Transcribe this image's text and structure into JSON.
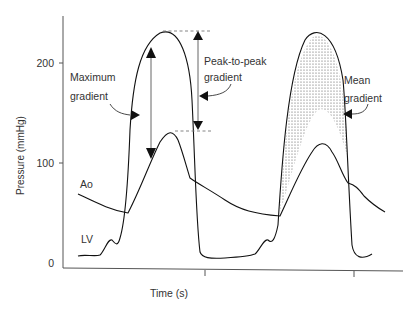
{
  "figure": {
    "y_axis": {
      "label": "Pressure (mmHg)",
      "ticks": [
        "200",
        "100",
        "0"
      ]
    },
    "x_axis": {
      "label": "Time (s)"
    },
    "curves": {
      "aorta_label": "Ao",
      "lv_label": "LV"
    },
    "annotations": {
      "maximum_line1": "Maximum",
      "maximum_line2": "gradient",
      "peak_line1": "Peak-to-peak",
      "peak_line2": "gradient",
      "mean_line1": "Mean",
      "mean_line2": "gradient"
    }
  }
}
